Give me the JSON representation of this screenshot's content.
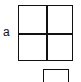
{
  "diagram": {
    "label": "a",
    "grid": {
      "rows": 2,
      "cols": 2
    },
    "partial_square_below": true,
    "stroke_color": "#111111"
  }
}
